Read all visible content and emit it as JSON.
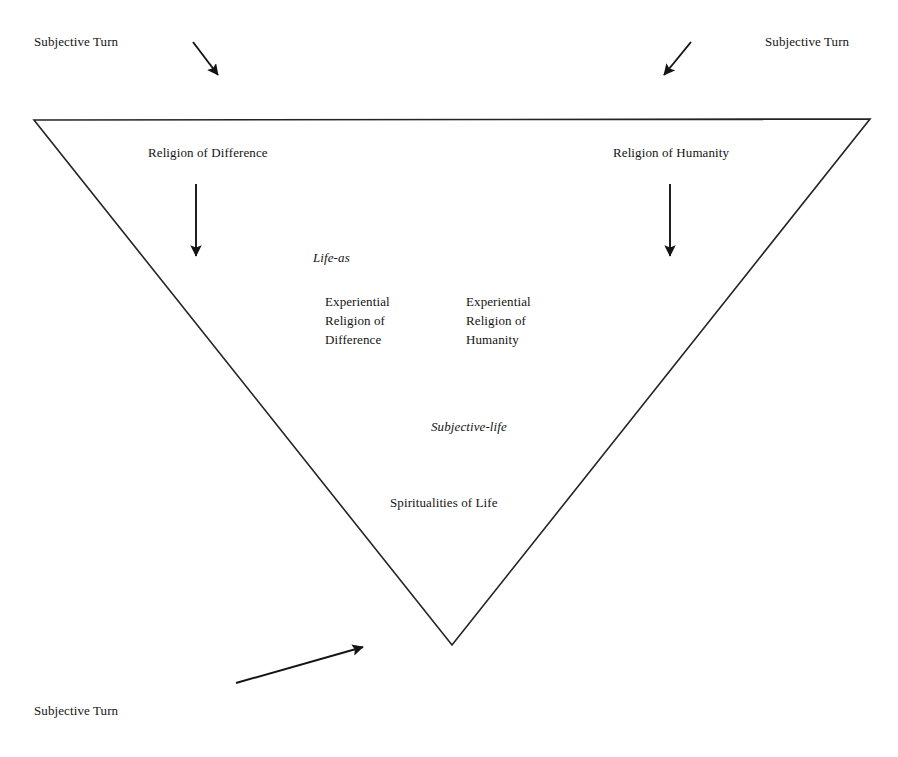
{
  "diagram": {
    "title_text": "",
    "shape": {
      "name": "inverted-triangle",
      "stroke_color": "#222222",
      "fill_color": "#ffffff",
      "stroke_width": 1.6,
      "points": "34,120 870,119 452,645"
    },
    "labels": {
      "subjective_turn_top_left": "Subjective Turn",
      "subjective_turn_top_right": "Subjective Turn",
      "subjective_turn_bottom_left": "Subjective Turn",
      "religion_of_difference": "Religion of Difference",
      "religion_of_humanity": "Religion of Humanity",
      "life_as": "Life-as",
      "experiential_religion_of_difference": "Experiential\nReligion of\nDifference",
      "experiential_religion_of_humanity": "Experiential\nReligion of\nHumanity",
      "subjective_life": "Subjective-life",
      "spiritualities_of_life": "Spiritualities of Life"
    },
    "arrows": [
      {
        "name": "arrow-top-left-diagonal",
        "direction": "down-right",
        "from": [
          193,
          42
        ],
        "to": [
          221,
          79
        ]
      },
      {
        "name": "arrow-top-right-diagonal",
        "direction": "down-left",
        "from": [
          691,
          42
        ],
        "to": [
          661,
          79
        ]
      },
      {
        "name": "arrow-religion-of-difference-down",
        "direction": "down",
        "from": [
          196,
          184
        ],
        "to": [
          196,
          262
        ]
      },
      {
        "name": "arrow-religion-of-humanity-down",
        "direction": "down",
        "from": [
          670,
          184
        ],
        "to": [
          670,
          262
        ]
      },
      {
        "name": "arrow-bottom-left-diagonal",
        "direction": "up-right",
        "from": [
          236,
          683
        ],
        "to": [
          368,
          645
        ]
      }
    ]
  }
}
